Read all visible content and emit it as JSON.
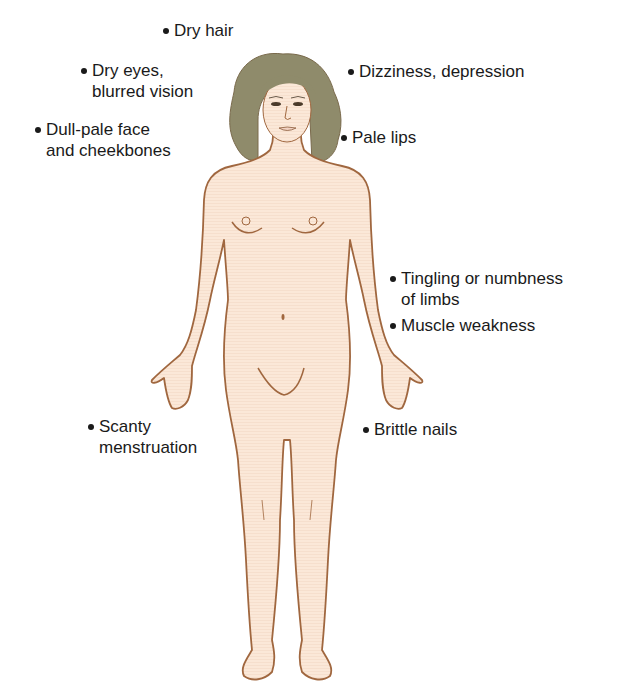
{
  "diagram": {
    "colors": {
      "skin": "#fbe8d8",
      "outline": "#a0673f",
      "hair": "#8f8b6b",
      "text": "#1a1a1a",
      "background": "#ffffff"
    },
    "labels": [
      {
        "id": "dry-hair",
        "lines": [
          "Dry hair"
        ]
      },
      {
        "id": "dry-eyes",
        "lines": [
          "Dry eyes,",
          "blurred vision"
        ]
      },
      {
        "id": "dull-pale-face",
        "lines": [
          "Dull-pale face",
          "and cheekbones"
        ]
      },
      {
        "id": "dizziness",
        "lines": [
          "Dizziness, depression"
        ]
      },
      {
        "id": "pale-lips",
        "lines": [
          "Pale lips"
        ]
      },
      {
        "id": "tingling",
        "lines": [
          "Tingling or numbness",
          "of limbs"
        ]
      },
      {
        "id": "muscle-weakness",
        "lines": [
          "Muscle weakness"
        ]
      },
      {
        "id": "scanty-menstruation",
        "lines": [
          "Scanty",
          "menstruation"
        ]
      },
      {
        "id": "brittle-nails",
        "lines": [
          "Brittle nails"
        ]
      }
    ]
  }
}
